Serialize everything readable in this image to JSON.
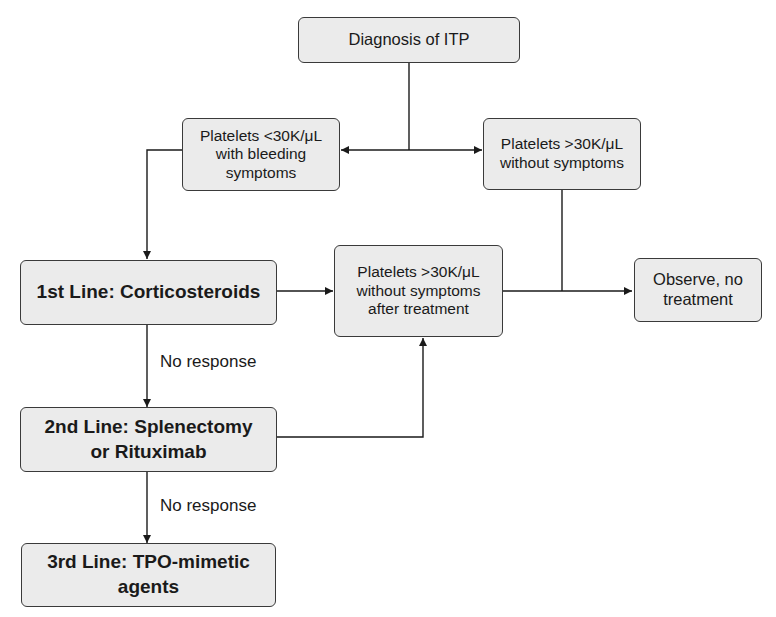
{
  "diagram": {
    "nodes": {
      "diagnosis": "Diagnosis of ITP",
      "low_platelets": "Platelets <30K/μL\nwith bleeding\nsymptoms",
      "high_platelets": "Platelets >30K/μL\nwithout symptoms",
      "first_line": "1st Line: Corticosteroids",
      "after_treatment": "Platelets >30K/μL\nwithout symptoms\nafter treatment",
      "observe": "Observe, no\ntreatment",
      "second_line": "2nd Line: Splenectomy\nor Rituximab",
      "third_line": "3rd Line: TPO-mimetic\nagents"
    },
    "edge_labels": {
      "no_response_1": "No response",
      "no_response_2": "No response"
    },
    "colors": {
      "box_fill": "#ebebeb",
      "box_border": "#3a3a3a",
      "line": "#1a1a1a"
    }
  }
}
